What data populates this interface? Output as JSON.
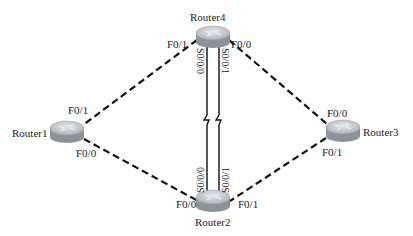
{
  "diagram": {
    "type": "network-topology",
    "nodes": [
      {
        "id": "r4",
        "label": "Router4",
        "x": 213,
        "y": 36
      },
      {
        "id": "r1",
        "label": "Router1",
        "x": 67,
        "y": 131
      },
      {
        "id": "r3",
        "label": "Router3",
        "x": 343,
        "y": 130
      },
      {
        "id": "r2",
        "label": "Router2",
        "x": 213,
        "y": 200
      }
    ],
    "links": [
      {
        "from": "r4",
        "to": "r1",
        "style": "dashed",
        "from_if": "F0/1",
        "to_if": "F0/1"
      },
      {
        "from": "r4",
        "to": "r3",
        "style": "dashed",
        "from_if": "F0/0",
        "to_if": "F0/0"
      },
      {
        "from": "r1",
        "to": "r2",
        "style": "dashed",
        "from_if": "F0/0",
        "to_if": "F0/0"
      },
      {
        "from": "r3",
        "to": "r2",
        "style": "dashed",
        "from_if": "F0/1",
        "to_if": "F0/1"
      },
      {
        "from": "r4",
        "to": "r2",
        "style": "serial",
        "from_if": "S0/0/0",
        "to_if": "S0/0/0"
      },
      {
        "from": "r4",
        "to": "r2",
        "style": "serial",
        "from_if": "S0/0/1",
        "to_if": "S0/0/1"
      }
    ],
    "interface_labels": {
      "r4_f01": "F0/1",
      "r4_f00": "F0/0",
      "r4_s000": "S0/0/0",
      "r4_s001": "S0/0/1",
      "r1_f01": "F0/1",
      "r1_f00": "F0/0",
      "r3_f00": "F0/0",
      "r3_f01": "F0/1",
      "r2_f00": "F0/0",
      "r2_f01": "F0/1",
      "r2_s000": "S0/0/0",
      "r2_s001": "S0/0/1"
    },
    "colors": {
      "background": "#ffffff",
      "line": "#111111",
      "router_top": "#c9cdd2",
      "router_side": "#9aa0a6"
    }
  }
}
